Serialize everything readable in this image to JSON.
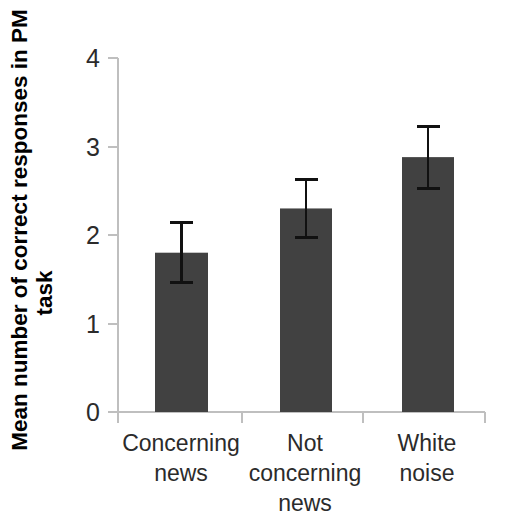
{
  "chart_data": {
    "type": "bar",
    "title": "",
    "xlabel": "",
    "ylabel": "Mean number of correct responses in PM task",
    "ylabel_line1": "Mean number of correct responses in PM",
    "ylabel_line2": "task",
    "categories": [
      "Concerning news",
      "Not concerning news",
      "White noise"
    ],
    "category_lines": [
      [
        "Concerning",
        "news"
      ],
      [
        "Not",
        "concerning",
        "news"
      ],
      [
        "White",
        "noise"
      ]
    ],
    "values": [
      1.8,
      2.3,
      2.88
    ],
    "errors": [
      0.34,
      0.33,
      0.35
    ],
    "ylim": [
      0,
      4
    ],
    "ytick_labels": [
      "0",
      "1",
      "2",
      "3",
      "4"
    ],
    "ytick_values": [
      0,
      1,
      2,
      3,
      4
    ],
    "grid": false,
    "legend": "none",
    "bar_color": "#414141",
    "axis_color": "#bfbfbf",
    "error_bar_color": "#111111"
  },
  "caption": {
    "partial_text": ""
  }
}
